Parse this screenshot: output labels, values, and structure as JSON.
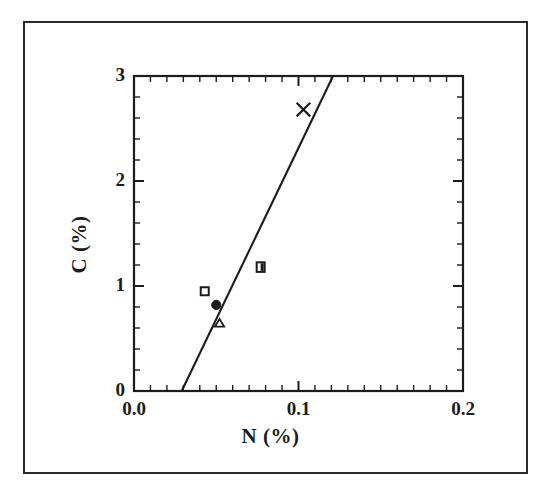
{
  "chart_data": {
    "type": "scatter",
    "title": "",
    "xlabel": "N (%)",
    "ylabel": "C (%)",
    "xlim": [
      0.0,
      0.2
    ],
    "ylim": [
      0,
      3
    ],
    "xticks": [
      0.0,
      0.1,
      0.2
    ],
    "xtick_labels": [
      "0.0",
      "0.1",
      "0.2"
    ],
    "yticks": [
      0,
      1,
      2,
      3
    ],
    "ytick_labels": [
      "0",
      "1",
      "2",
      "3"
    ],
    "x_minor_ticks_per_major": 10,
    "y_minor_ticks_per_major": 5,
    "grid": false,
    "legend": false,
    "frame": "box",
    "tick_direction": "in",
    "points": [
      {
        "marker": "open-square",
        "x": 0.043,
        "y": 0.95
      },
      {
        "marker": "filled-circle",
        "x": 0.05,
        "y": 0.82
      },
      {
        "marker": "open-triangle",
        "x": 0.052,
        "y": 0.65
      },
      {
        "marker": "half-filled-square",
        "x": 0.077,
        "y": 1.18
      },
      {
        "marker": "cross-x",
        "x": 0.103,
        "y": 2.68
      }
    ],
    "series": [
      {
        "name": "trend-line",
        "type": "line",
        "x": [
          0.029,
          0.121
        ],
        "values": [
          0.0,
          3.0
        ]
      }
    ]
  },
  "axes": {
    "x_title": "N (%)",
    "y_title": "C (%)"
  },
  "colors": {
    "ink": "#1c1c1c",
    "frame": "#2a2a2a",
    "marker": "#1c1c1c"
  }
}
